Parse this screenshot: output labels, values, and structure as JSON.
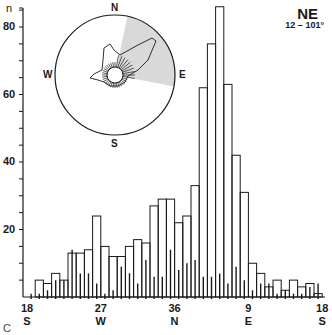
{
  "chart_data": {
    "type": "bar",
    "title": "NE",
    "subtitle": "12 – 101°",
    "panel_label": "C",
    "ylabel": "n",
    "ylim": [
      0,
      87
    ],
    "yticks": [
      20,
      40,
      60,
      80
    ],
    "y_minor_tick_step": 5,
    "xlabel": "",
    "x_tick_labels": [
      {
        "value": "18",
        "dir": "S"
      },
      {
        "value": "27",
        "dir": "W"
      },
      {
        "value": "36",
        "dir": "N"
      },
      {
        "value": "9",
        "dir": "E"
      },
      {
        "value": "18",
        "dir": "S"
      }
    ],
    "bin_width_deg": 10,
    "categories": [
      "180",
      "190",
      "200",
      "210",
      "220",
      "230",
      "240",
      "250",
      "260",
      "270",
      "280",
      "290",
      "300",
      "310",
      "320",
      "330",
      "340",
      "350",
      "0",
      "10",
      "20",
      "30",
      "40",
      "50",
      "60",
      "70",
      "80",
      "90",
      "100",
      "110",
      "120",
      "130",
      "140",
      "150",
      "160",
      "170"
    ],
    "series": [
      {
        "name": "outline bars",
        "values": [
          0,
          5,
          4,
          7,
          5,
          13,
          13,
          14,
          24,
          15,
          12,
          12,
          15,
          17,
          16,
          27,
          29,
          29,
          22,
          24,
          33,
          62,
          75,
          86,
          63,
          42,
          31,
          10,
          7,
          3,
          5,
          2,
          5,
          3,
          4,
          1
        ]
      },
      {
        "name": "inner spikes",
        "values": [
          1,
          1,
          2,
          5,
          5,
          14,
          7,
          7,
          4,
          1,
          2,
          9,
          7,
          4,
          11,
          6,
          6,
          14,
          8,
          10,
          11,
          6,
          6,
          7,
          4,
          9,
          5,
          2,
          4,
          4,
          1,
          2,
          1,
          1,
          3,
          4
        ]
      }
    ],
    "grid": false,
    "inset": {
      "type": "rose-diagram",
      "compass_labels": [
        "N",
        "E",
        "S",
        "W"
      ],
      "shaded_sector_deg": [
        12,
        101
      ]
    }
  },
  "colors": {
    "line": "#1a1a1a",
    "shade": "#d9d9d9",
    "background": "#ffffff"
  }
}
